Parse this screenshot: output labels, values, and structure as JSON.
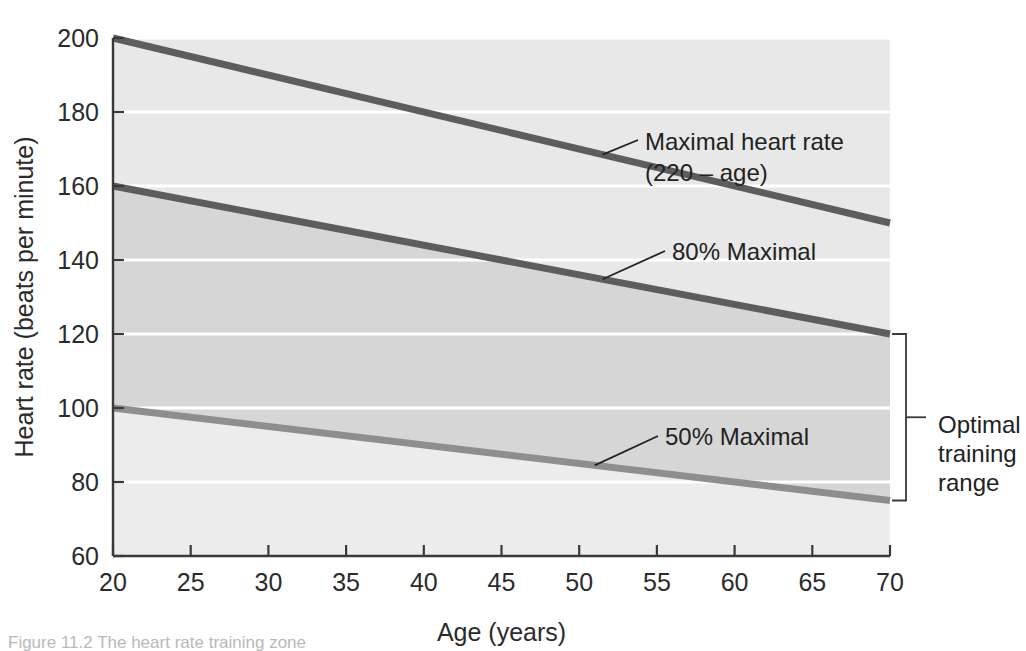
{
  "chart_data": {
    "type": "line",
    "title": "",
    "xlabel": "Age (years)",
    "ylabel": "Heart rate (beats per minute)",
    "xlim": [
      20,
      70
    ],
    "ylim": [
      60,
      200
    ],
    "xticks": [
      20,
      25,
      30,
      35,
      40,
      45,
      50,
      55,
      60,
      65,
      70
    ],
    "yticks": [
      60,
      80,
      100,
      120,
      140,
      160,
      180,
      200
    ],
    "xtick_labels": [
      "20",
      "25",
      "30",
      "35",
      "40",
      "45",
      "50",
      "55",
      "60",
      "65",
      "70"
    ],
    "ytick_labels": [
      "60",
      "80",
      "100",
      "120",
      "140",
      "160",
      "180",
      "200"
    ],
    "grid": "horizontal-white",
    "legend": "none",
    "x": [
      20,
      70
    ],
    "series": [
      {
        "name": "Maximal heart rate (220 - age)",
        "values": [
          200,
          150
        ],
        "color": "#5d5d5d",
        "width": 7
      },
      {
        "name": "80% Maximal",
        "values": [
          160,
          120
        ],
        "color": "#5d5d5d",
        "width": 7
      },
      {
        "name": "50% Maximal",
        "values": [
          100,
          75
        ],
        "color": "#8e8e8e",
        "width": 7
      }
    ],
    "bands": [
      {
        "name": "above-maximal-to-80-percent",
        "upper_series": "Maximal heart rate (220 - age)",
        "lower_series": "80% Maximal",
        "color": "#e8e8e8"
      },
      {
        "name": "optimal-training-range-band",
        "upper_series": "80% Maximal",
        "lower_series": "50% Maximal",
        "color": "#d6d6d6"
      },
      {
        "name": "below-50-percent",
        "lower_bound": 60,
        "upper_series": "50% Maximal",
        "color": "#ececec"
      }
    ],
    "annotations": [
      {
        "id": "maximal-heart-rate",
        "line1": "Maximal heart rate",
        "line2": "(220 – age)",
        "anchor_age": 51.5,
        "anchor_value": 168
      },
      {
        "id": "eighty-percent-maximal",
        "line1": "80% Maximal",
        "line2": "",
        "anchor_age": 51.5,
        "anchor_value": 135
      },
      {
        "id": "fifty-percent-maximal",
        "line1": "50% Maximal",
        "line2": "",
        "anchor_age": 51,
        "anchor_value": 87.5
      },
      {
        "id": "optimal-training-range",
        "line1": "Optimal",
        "line2": "training",
        "line3": "range",
        "bracket_top_value": 120,
        "bracket_bottom_value": 75
      }
    ]
  },
  "caption": {
    "text": "Figure 11.2   The heart rate training zone"
  },
  "colors": {
    "band_upper": "#e8e8e8",
    "band_middle": "#d6d6d6",
    "band_lower": "#ececec",
    "line_dark": "#5d5d5d",
    "line_light": "#8e8e8e",
    "axis": "#3a3a3a",
    "gridline": "#ffffff",
    "text": "#222222"
  }
}
